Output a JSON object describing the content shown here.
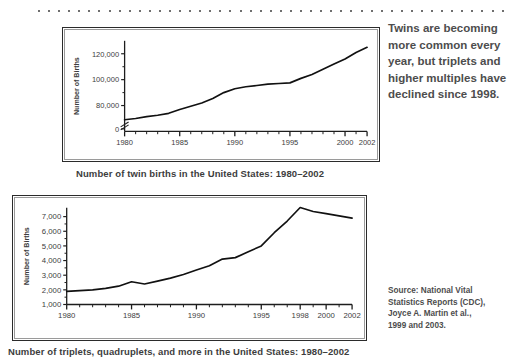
{
  "decoration": {
    "dot_count": 47
  },
  "pull_quote": "Twins are becoming more common every year, but triplets and higher multiples have declined since 1998.",
  "source_note": {
    "line1": "Source: National Vital",
    "line2": "Statistics Reports (CDC),",
    "line3": "Joyce A. Martin et al.,",
    "line4": "1999 and 2003."
  },
  "chart_data": [
    {
      "id": "twin-births",
      "type": "line",
      "title": "Number of twin births in the United States: 1980–2002",
      "xlabel": "",
      "ylabel": "Number of Births",
      "xlim": [
        1980,
        2002
      ],
      "ylim": [
        60000,
        130000
      ],
      "axis_break": true,
      "grid": false,
      "legend": "none",
      "y_ticks": [
        "0",
        "80,000",
        "100,000",
        "120,000"
      ],
      "y_tick_values": [
        62000,
        80000,
        100000,
        120000
      ],
      "x_ticks": [
        "1980",
        "1985",
        "1990",
        "1995",
        "2000",
        "2002"
      ],
      "x_tick_values": [
        1980,
        1985,
        1990,
        1995,
        2000,
        2002
      ],
      "x": [
        1980,
        1981,
        1982,
        1983,
        1984,
        1985,
        1986,
        1987,
        1988,
        1989,
        1990,
        1991,
        1992,
        1993,
        1994,
        1995,
        1996,
        1997,
        1998,
        1999,
        2000,
        2001,
        2002
      ],
      "values": [
        69000,
        70000,
        71500,
        72500,
        74000,
        77000,
        79500,
        82000,
        85500,
        90000,
        93000,
        94500,
        95500,
        96500,
        97000,
        97500,
        101000,
        104000,
        108000,
        112000,
        116000,
        121000,
        125000
      ]
    },
    {
      "id": "triplets-and-more",
      "type": "line",
      "title": "Number of triplets, quadruplets, and more in the United States: 1980–2002",
      "xlabel": "",
      "ylabel": "Number of Births",
      "xlim": [
        1980,
        2002
      ],
      "ylim": [
        1000,
        7600
      ],
      "axis_break": false,
      "grid": false,
      "legend": "none",
      "y_ticks": [
        "1,000",
        "2,000",
        "3,000",
        "4,000",
        "5,000",
        "6,000",
        "7,000"
      ],
      "y_tick_values": [
        1000,
        2000,
        3000,
        4000,
        5000,
        6000,
        7000
      ],
      "x_ticks": [
        "1980",
        "1985",
        "1990",
        "1995",
        "1998",
        "2000",
        "2002"
      ],
      "x_tick_values": [
        1980,
        1985,
        1990,
        1995,
        1998,
        2000,
        2002
      ],
      "x": [
        1980,
        1981,
        1982,
        1983,
        1984,
        1985,
        1986,
        1987,
        1988,
        1989,
        1990,
        1991,
        1992,
        1993,
        1994,
        1995,
        1996,
        1997,
        1998,
        1999,
        2000,
        2001,
        2002
      ],
      "values": [
        1900,
        1950,
        2000,
        2100,
        2250,
        2550,
        2400,
        2600,
        2800,
        3050,
        3350,
        3650,
        4100,
        4200,
        4600,
        5000,
        5900,
        6700,
        7620,
        7350,
        7200,
        7050,
        6900
      ]
    }
  ]
}
